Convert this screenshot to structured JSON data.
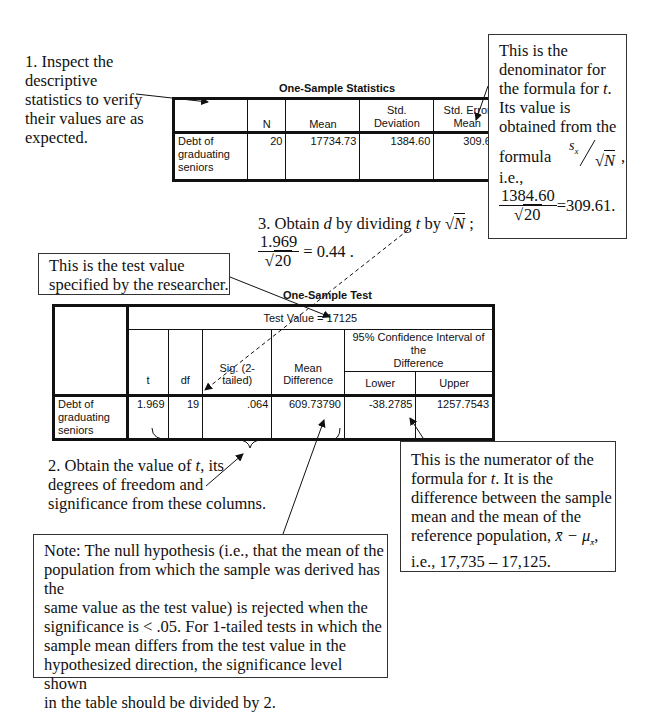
{
  "annotations": {
    "step1": {
      "label": "1. Inspect the descriptive statistics to verify their values are as expected.",
      "lines": [
        "1. Inspect the",
        "descriptive",
        "statistics to verify",
        "their values are as",
        "expected."
      ]
    },
    "denominator_note": {
      "lines": [
        "This is the",
        "denominator for",
        "the formula for",
        "Its value is",
        "obtained from the",
        "formula",
        "i.e.,"
      ],
      "t_symbol": "t",
      "formula_numerator": "s",
      "formula_subscript": "x",
      "formula_denominator": "N",
      "calc_numerator": "1384.60",
      "calc_denominator": "20",
      "calc_result": "=309.61."
    },
    "step3": {
      "prefix": "3. Obtain",
      "d_symbol": "d",
      "middle": "by dividing",
      "t_symbol": "t",
      "by": "by",
      "sqrt_arg": "N",
      "suffix": ";",
      "frac_numerator": "1.969",
      "frac_denominator": "20",
      "result": "= 0.44 ."
    },
    "test_value_note": {
      "lines": [
        "This is the test value",
        "specified by the researcher."
      ]
    },
    "step2": {
      "line1_prefix": "2. Obtain the value of",
      "t_symbol": "t",
      "line1_suffix": ", its",
      "line2": "degrees of freedom and",
      "line3": "significance from these columns."
    },
    "numerator_note": {
      "line1": "This is the numerator of the",
      "line2_prefix": "formula for",
      "t_symbol": "t",
      "line2_suffix": ". It is the",
      "line3": "difference between the sample",
      "line4": "mean and the mean of the",
      "line5_prefix": "reference population,",
      "line5_formula": "x̄ − μ",
      "line5_sub": "x̄",
      "line5_suffix": ",",
      "line6": "i.e., 17,735 – 17,125."
    },
    "null_hypothesis_note": {
      "lines": [
        "Note: The null hypothesis (i.e., that the mean of the",
        "population from which the sample was derived has the",
        "same value as the test value) is rejected when the",
        "significance is < .05. For 1-tailed tests in which the",
        "sample mean differs from the test value in the",
        "hypothesized direction, the significance level shown",
        "in the table should be divided by 2."
      ]
    }
  },
  "one_sample_statistics": {
    "title": "One-Sample Statistics",
    "headers": [
      "",
      "N",
      "Mean",
      "Std. Deviation",
      "Std. Error Mean"
    ],
    "header_lines": {
      "std_dev": [
        "Std.",
        "Deviation"
      ],
      "std_err": [
        "Std. Error",
        "Mean"
      ]
    },
    "rows": [
      {
        "label": "Debt of graduating seniors",
        "label_lines": [
          "Debt of",
          "graduating",
          "seniors"
        ],
        "n": "20",
        "mean": "17734.73",
        "std_dev": "1384.60",
        "std_err": "309.61"
      }
    ]
  },
  "one_sample_test": {
    "title": "One-Sample Test",
    "test_value_header": "Test Value = 17125",
    "ci_header": "95% Confidence Interval of the Difference",
    "ci_header_lines": [
      "95% Confidence Interval of the",
      "Difference"
    ],
    "headers": [
      "t",
      "df",
      "Sig. (2-tailed)",
      "Mean Difference",
      "Lower",
      "Upper"
    ],
    "rows": [
      {
        "label": "Debt of graduating seniors",
        "label_lines": [
          "Debt of graduating",
          "seniors"
        ],
        "t": "1.969",
        "df": "19",
        "sig": ".064",
        "mean_diff": "609.73790",
        "lower": "-38.2785",
        "upper": "1257.7543"
      }
    ]
  }
}
